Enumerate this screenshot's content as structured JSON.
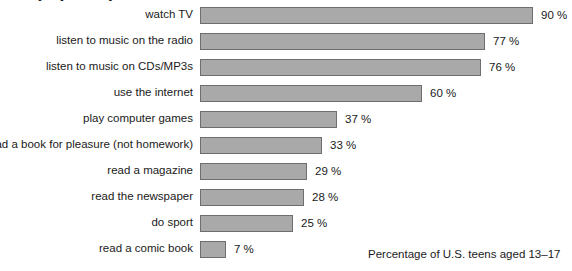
{
  "clipped_title": "Everyday activity",
  "caption": "Percentage of U.S. teens aged 13–17",
  "style": {
    "bar_fill": "#a9a9a9",
    "bar_border": "#6e6e6e",
    "text_color": "#1a1a1a",
    "background": "#ffffff"
  },
  "chart_data": {
    "type": "bar",
    "orientation": "horizontal",
    "title": "",
    "xlabel": "",
    "ylabel": "",
    "xlim": [
      0,
      100
    ],
    "grid": false,
    "legend": null,
    "value_suffix": " %",
    "px_per_percent": 3.7,
    "categories": [
      "watch TV",
      "listen to music on the radio",
      "listen to music on CDs/MP3s",
      "use the internet",
      "play computer games",
      "read a book for pleasure (not homework)",
      "read a magazine",
      "read the newspaper",
      "do sport",
      "read a comic book"
    ],
    "values": [
      90,
      77,
      76,
      60,
      37,
      33,
      29,
      28,
      25,
      7
    ],
    "value_labels": [
      "90 %",
      "77 %",
      "76 %",
      "60 %",
      "37 %",
      "33 %",
      "29 %",
      "28 %",
      "25 %",
      "7 %"
    ],
    "annotation": "Percentage of U.S. teens aged 13–17"
  }
}
